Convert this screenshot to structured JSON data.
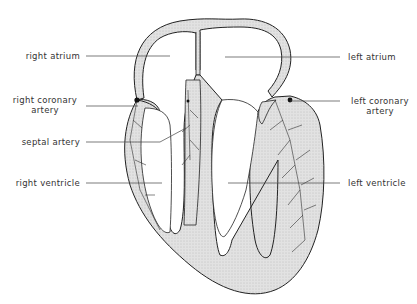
{
  "diagram": {
    "type": "anatomical-heart-section",
    "labels": {
      "right_atrium": "right atrium",
      "right_coronary_artery_line1": "right coronary",
      "right_coronary_artery_line2": "artery",
      "septal_artery": "septal artery",
      "right_ventricle": "right ventricle",
      "left_atrium": "left atrium",
      "left_coronary_artery_line1": "left coronary",
      "left_coronary_artery_line2": "artery",
      "left_ventricle": "left ventricle"
    },
    "colors": {
      "muscle_fill": "#d9d9d9",
      "outline": "#222222",
      "label_text": "#333333",
      "background": "#ffffff"
    }
  }
}
